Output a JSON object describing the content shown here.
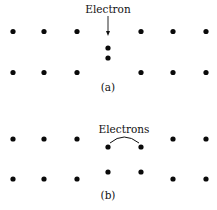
{
  "panel_a": {
    "label": "Electron",
    "caption": "(a)",
    "top_row": [
      13,
      44,
      77,
      141,
      173,
      206
    ],
    "bottom_row": [
      13,
      44,
      77,
      141,
      173,
      206
    ],
    "interstitial": [
      {
        "x": 108,
        "y": 48
      },
      {
        "x": 108,
        "y": 58
      }
    ]
  },
  "panel_b": {
    "label": "Electrons",
    "caption": "(b)",
    "top_row": [
      13,
      44,
      77,
      173,
      206
    ],
    "bottom_row": [
      13,
      44,
      77,
      173,
      206
    ],
    "pair_upper": [
      {
        "x": 108,
        "y": 147
      },
      {
        "x": 141,
        "y": 147
      }
    ],
    "pair_lower": [
      {
        "x": 108,
        "y": 172
      },
      {
        "x": 141,
        "y": 172
      }
    ]
  },
  "colors": {
    "dot": "#0a0a0a",
    "text": "#111111",
    "background": "#ffffff"
  }
}
